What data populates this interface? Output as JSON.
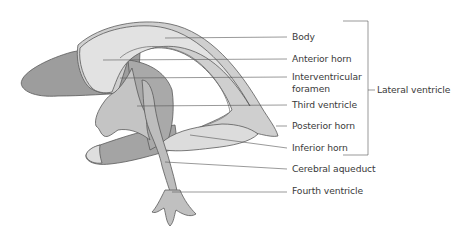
{
  "labels": {
    "body": "Body",
    "anterior_horn": "Anterior horn",
    "interventricular_1": "Interventricular",
    "interventricular_2": "foramen",
    "third_ventricle": "Third ventricle",
    "posterior_horn": "Posterior horn",
    "inferior_horn": "Inferior horn",
    "cerebral_aqueduct": "Cerebral aqueduct",
    "fourth_ventricle": "Fourth ventricle",
    "lateral_ventricle": "Lateral ventricle"
  },
  "colors": {
    "dark_fill": "#9a9a9a",
    "mid_fill": "#b8b8b8",
    "light_fill": "#d6d6d6",
    "lighter_fill": "#e4e4e4",
    "outline": "#5a5a5a",
    "leader": "#555555",
    "text": "#3a3a3a"
  }
}
